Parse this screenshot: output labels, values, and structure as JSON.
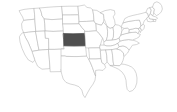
{
  "map": {
    "title": "United States map with Kansas highlighted",
    "type": "choropleth-locator",
    "region": "United States of America",
    "projection": "albers-usa-like",
    "background_color": "#ffffff",
    "default_state_fill": "#ffffff",
    "state_border_color": "#b4b4b4",
    "highlight_fill": "#4f4f4f",
    "highlight_border_color": "#3d3d3d",
    "highlighted_states": [
      "Kansas"
    ],
    "highlighted_state": "Kansas",
    "highlighted_state_abbr": "KS",
    "legend_visible": false,
    "labels_visible": false,
    "states": [
      {
        "abbr": "WA",
        "name": "Washington",
        "highlighted": false
      },
      {
        "abbr": "OR",
        "name": "Oregon",
        "highlighted": false
      },
      {
        "abbr": "CA",
        "name": "California",
        "highlighted": false
      },
      {
        "abbr": "ID",
        "name": "Idaho",
        "highlighted": false
      },
      {
        "abbr": "NV",
        "name": "Nevada",
        "highlighted": false
      },
      {
        "abbr": "MT",
        "name": "Montana",
        "highlighted": false
      },
      {
        "abbr": "WY",
        "name": "Wyoming",
        "highlighted": false
      },
      {
        "abbr": "UT",
        "name": "Utah",
        "highlighted": false
      },
      {
        "abbr": "AZ",
        "name": "Arizona",
        "highlighted": false
      },
      {
        "abbr": "CO",
        "name": "Colorado",
        "highlighted": false
      },
      {
        "abbr": "NM",
        "name": "New Mexico",
        "highlighted": false
      },
      {
        "abbr": "ND",
        "name": "North Dakota",
        "highlighted": false
      },
      {
        "abbr": "SD",
        "name": "South Dakota",
        "highlighted": false
      },
      {
        "abbr": "NE",
        "name": "Nebraska",
        "highlighted": false
      },
      {
        "abbr": "KS",
        "name": "Kansas",
        "highlighted": true
      },
      {
        "abbr": "OK",
        "name": "Oklahoma",
        "highlighted": false
      },
      {
        "abbr": "TX",
        "name": "Texas",
        "highlighted": false
      },
      {
        "abbr": "MN",
        "name": "Minnesota",
        "highlighted": false
      },
      {
        "abbr": "IA",
        "name": "Iowa",
        "highlighted": false
      },
      {
        "abbr": "MO",
        "name": "Missouri",
        "highlighted": false
      },
      {
        "abbr": "AR",
        "name": "Arkansas",
        "highlighted": false
      },
      {
        "abbr": "LA",
        "name": "Louisiana",
        "highlighted": false
      },
      {
        "abbr": "WI",
        "name": "Wisconsin",
        "highlighted": false
      },
      {
        "abbr": "IL",
        "name": "Illinois",
        "highlighted": false
      },
      {
        "abbr": "MI",
        "name": "Michigan",
        "highlighted": false
      },
      {
        "abbr": "IN",
        "name": "Indiana",
        "highlighted": false
      },
      {
        "abbr": "OH",
        "name": "Ohio",
        "highlighted": false
      },
      {
        "abbr": "KY",
        "name": "Kentucky",
        "highlighted": false
      },
      {
        "abbr": "TN",
        "name": "Tennessee",
        "highlighted": false
      },
      {
        "abbr": "MS",
        "name": "Mississippi",
        "highlighted": false
      },
      {
        "abbr": "AL",
        "name": "Alabama",
        "highlighted": false
      },
      {
        "abbr": "GA",
        "name": "Georgia",
        "highlighted": false
      },
      {
        "abbr": "FL",
        "name": "Florida",
        "highlighted": false
      },
      {
        "abbr": "SC",
        "name": "South Carolina",
        "highlighted": false
      },
      {
        "abbr": "NC",
        "name": "North Carolina",
        "highlighted": false
      },
      {
        "abbr": "VA",
        "name": "Virginia",
        "highlighted": false
      },
      {
        "abbr": "WV",
        "name": "West Virginia",
        "highlighted": false
      },
      {
        "abbr": "MD",
        "name": "Maryland",
        "highlighted": false
      },
      {
        "abbr": "DE",
        "name": "Delaware",
        "highlighted": false
      },
      {
        "abbr": "PA",
        "name": "Pennsylvania",
        "highlighted": false
      },
      {
        "abbr": "NJ",
        "name": "New Jersey",
        "highlighted": false
      },
      {
        "abbr": "NY",
        "name": "New York",
        "highlighted": false
      },
      {
        "abbr": "CT",
        "name": "Connecticut",
        "highlighted": false
      },
      {
        "abbr": "RI",
        "name": "Rhode Island",
        "highlighted": false
      },
      {
        "abbr": "MA",
        "name": "Massachusetts",
        "highlighted": false
      },
      {
        "abbr": "VT",
        "name": "Vermont",
        "highlighted": false
      },
      {
        "abbr": "NH",
        "name": "New Hampshire",
        "highlighted": false
      },
      {
        "abbr": "ME",
        "name": "Maine",
        "highlighted": false
      }
    ]
  }
}
